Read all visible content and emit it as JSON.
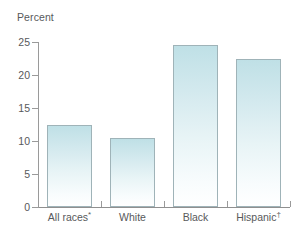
{
  "chart_data": {
    "type": "bar",
    "title": "",
    "subtitle": "",
    "xlabel": "",
    "ylabel": "Percent",
    "ylim": [
      0,
      25
    ],
    "ytick_values": [
      0,
      5,
      10,
      15,
      20,
      25
    ],
    "ytick_labels": [
      "0",
      "5",
      "10",
      "15",
      "20",
      "25"
    ],
    "grid": false,
    "legend": null,
    "categories": [
      "All races*",
      "White",
      "Black",
      "Hispanic†"
    ],
    "category_plain": [
      "All races",
      "White",
      "Black",
      "Hispanic"
    ],
    "category_marks": [
      "*",
      "",
      "",
      "†"
    ],
    "values": [
      12.5,
      10.5,
      24.5,
      22.5
    ],
    "bar_fill_top_color": "#bfe0e6",
    "bar_fill_bottom_color": "#ffffff",
    "bar_border_color": "#9fb3b8",
    "axis_color": "#9a9a9a",
    "text_color": "#58595b"
  },
  "axis": {
    "y_title": "Percent"
  }
}
